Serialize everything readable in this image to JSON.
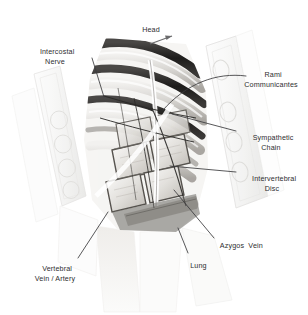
{
  "figure": {
    "style": "grayscale pencil medical illustration",
    "background_color": "#ffffff",
    "label_color": "#2e2e30",
    "leader_color": "#3a3a3c"
  },
  "orientation": {
    "label": "Head",
    "arrow_icon": "arrow-up-right-icon",
    "x": 146,
    "y": 30
  },
  "labels": [
    {
      "id": "intercostal-nerve",
      "line1": "Intercostal",
      "line2": "Nerve",
      "text": "Intercostal Nerve",
      "x": 48,
      "y": 40,
      "align": "center",
      "leader": "M 92 58 L 104 97"
    },
    {
      "id": "rami-communicantes",
      "line1": "Rami",
      "line2": "Communicantes",
      "text": "Rami Communicantes",
      "x": 238,
      "y": 63,
      "align": "center",
      "leader": "M 246 76 C 216 72 186 84 163 110"
    },
    {
      "id": "sympathetic-chain",
      "line1": "Sympathetic",
      "line2": "Chain",
      "text": "Sympathetic Chain",
      "x": 238,
      "y": 127,
      "align": "center",
      "leader": "M 236 131 L 172 114"
    },
    {
      "id": "intervertebral-disc",
      "line1": "Intervertebral",
      "line2": "Disc",
      "text": "Intervertebral Disc",
      "x": 238,
      "y": 168,
      "align": "center",
      "leader": "M 236 172 L 170 166"
    },
    {
      "id": "azygos-vein",
      "line1": "Azygos  Vein",
      "line2": "",
      "text": "Azygos Vein",
      "x": 216,
      "y": 237,
      "align": "left",
      "leader": "M 214 238 L 174 190"
    },
    {
      "id": "lung",
      "line1": "Lung",
      "line2": "",
      "text": "Lung",
      "x": 186,
      "y": 257,
      "align": "left",
      "leader": "M 188 253 L 178 228"
    },
    {
      "id": "vertebral-vein-artery",
      "line1": "Vertebral",
      "line2": "Vein / Artery",
      "text": "Vertebral Vein / Artery",
      "x": 40,
      "y": 258,
      "align": "center",
      "leader": "M 78 258 L 108 212"
    }
  ],
  "anatomy": {
    "ribs_count": 6,
    "vertebral_bodies_count": 4,
    "retractor_left": "retractor-blade-left",
    "retractor_right": "retractor-blade-right"
  }
}
